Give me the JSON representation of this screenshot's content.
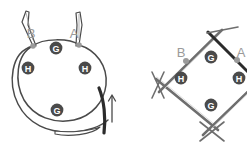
{
  "figure": {
    "background_color": "#ffffff",
    "panels": [
      {
        "id": "left-panel",
        "name": "circular-needle-diagram",
        "description": "Circular knitting needle loop with stitch markers",
        "endpoint_labels": [
          {
            "text": "B",
            "x": 31,
            "y": 33
          },
          {
            "text": "A",
            "x": 74,
            "y": 33
          }
        ],
        "endpoint_dots": [
          {
            "name": "marker-dot-b",
            "x": 33,
            "y": 46,
            "r": 2.8,
            "color": "#9a9a9a"
          },
          {
            "name": "marker-dot-a",
            "x": 79,
            "y": 45,
            "r": 2.8,
            "color": "#9a9a9a"
          }
        ],
        "stitch_markers": [
          {
            "letter": "G",
            "x": 56,
            "y": 48,
            "r": 6.4,
            "fill": "#4a4a4a"
          },
          {
            "letter": "H",
            "x": 28,
            "y": 68,
            "r": 6.4,
            "fill": "#4a4a4a"
          },
          {
            "letter": "H",
            "x": 85,
            "y": 68,
            "r": 6.4,
            "fill": "#4a4a4a"
          },
          {
            "letter": "G",
            "x": 57,
            "y": 110,
            "r": 6.4,
            "fill": "#4a4a4a"
          }
        ],
        "arrow": {
          "name": "direction-arrow",
          "label": "",
          "color": "#4a4a4a",
          "from_x": 110,
          "from_y": 119,
          "to_x": 110,
          "to_y": 95
        },
        "working_yarn_color": "#2b2b2b",
        "needle_color": "#4a4a4a",
        "cord_color": "#4a4a4a"
      },
      {
        "id": "right-panel",
        "name": "dpn-square-diagram",
        "description": "Four double-pointed needles arranged in a diamond with stitch markers",
        "endpoint_labels": [
          {
            "text": "B",
            "x": 181,
            "y": 52
          },
          {
            "text": "A",
            "x": 241,
            "y": 52
          }
        ],
        "endpoint_dots": [
          {
            "name": "marker-dot-b",
            "x": 186,
            "y": 61,
            "r": 2.8,
            "color": "#9a9a9a"
          },
          {
            "name": "marker-dot-a",
            "x": 237,
            "y": 60,
            "r": 2.8,
            "color": "#9a9a9a"
          }
        ],
        "stitch_markers": [
          {
            "letter": "G",
            "x": 211,
            "y": 57,
            "r": 6.4,
            "fill": "#4a4a4a"
          },
          {
            "letter": "H",
            "x": 181,
            "y": 78,
            "r": 6.4,
            "fill": "#4a4a4a"
          },
          {
            "letter": "H",
            "x": 239,
            "y": 78,
            "r": 6.4,
            "fill": "#4a4a4a"
          },
          {
            "letter": "G",
            "x": 211,
            "y": 105,
            "r": 6.4,
            "fill": "#4a4a4a"
          }
        ],
        "needle_color": "#6e6e6e",
        "active_needle_color": "#2b2b2b"
      }
    ],
    "palette": {
      "needle_gray": "#6e6e6e",
      "needle_dark": "#4a4a4a",
      "working_yarn": "#2b2b2b",
      "marker_fill": "#4a4a4a",
      "marker_text": "#ffffff",
      "label_gray": "#9a9a9a",
      "dot_gray": "#9a9a9a",
      "background": "#ffffff"
    }
  }
}
